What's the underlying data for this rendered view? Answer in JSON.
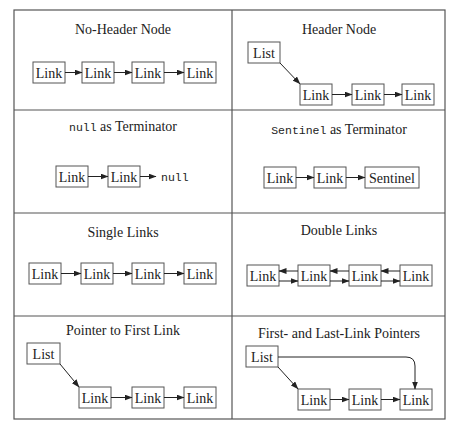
{
  "panels": [
    {
      "id": "no-header",
      "title": "No-Header Node",
      "nodes": [
        "Link",
        "Link",
        "Link",
        "Link"
      ]
    },
    {
      "id": "header",
      "title": "Header Node",
      "head": "List",
      "nodes": [
        "Link",
        "Link",
        "Link"
      ]
    },
    {
      "id": "null-term",
      "title_code": "null",
      "title_rest": " as Terminator",
      "nodes": [
        "Link",
        "Link"
      ],
      "terminator": "null"
    },
    {
      "id": "sentinel-term",
      "title_code": "Sentinel",
      "title_rest": " as Terminator",
      "nodes": [
        "Link",
        "Link",
        "Sentinel"
      ]
    },
    {
      "id": "single",
      "title": "Single Links",
      "nodes": [
        "Link",
        "Link",
        "Link",
        "Link"
      ]
    },
    {
      "id": "double",
      "title": "Double Links",
      "nodes": [
        "Link",
        "Link",
        "Link",
        "Link"
      ]
    },
    {
      "id": "first-ptr",
      "title": "Pointer to First Link",
      "head": "List",
      "nodes": [
        "Link",
        "Link",
        "Link"
      ]
    },
    {
      "id": "first-last",
      "title": "First- and Last-Link Pointers",
      "head": "List",
      "nodes": [
        "Link",
        "Link",
        "Link"
      ]
    }
  ]
}
